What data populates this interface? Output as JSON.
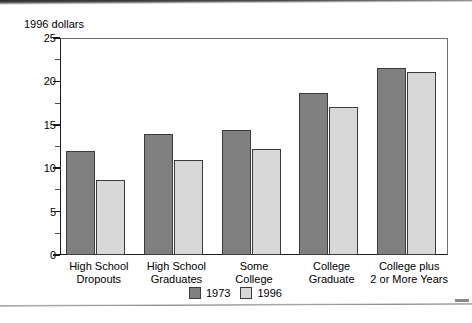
{
  "chart_data": {
    "type": "bar",
    "title": "",
    "subtitle": "",
    "xlabel": "",
    "ylabel": "1996 dollars",
    "ylim": [
      0,
      25
    ],
    "ytick_values": [
      0,
      5,
      10,
      15,
      20,
      25
    ],
    "ytick_labels": [
      "0",
      "5",
      "10",
      "15",
      "20",
      "25"
    ],
    "yminor_tick_values": [
      2.5,
      7.5,
      12.5,
      17.5,
      22.5
    ],
    "grid": false,
    "legend_position": "bottom-center",
    "categories": [
      "High School Dropouts",
      "High School Graduates",
      "Some College",
      "College Graduate",
      "College plus 2 or More Years"
    ],
    "category_lines": [
      [
        "High School",
        "Dropouts"
      ],
      [
        "High School",
        "Graduates"
      ],
      [
        "Some",
        "College"
      ],
      [
        "College",
        "Graduate"
      ],
      [
        "College plus",
        "2 or More Years"
      ]
    ],
    "series": [
      {
        "name": "1973",
        "color": "#808080",
        "values": [
          12.0,
          13.9,
          14.4,
          18.7,
          21.6
        ]
      },
      {
        "name": "1996",
        "color": "#d8d8d8",
        "values": [
          8.6,
          11.0,
          12.2,
          17.1,
          21.1
        ]
      }
    ]
  },
  "axis": {
    "title": "1996 dollars"
  },
  "legend": {
    "items": [
      {
        "label": "1973"
      },
      {
        "label": "1996"
      }
    ]
  },
  "artifacts": {
    "bottom_text": ""
  }
}
